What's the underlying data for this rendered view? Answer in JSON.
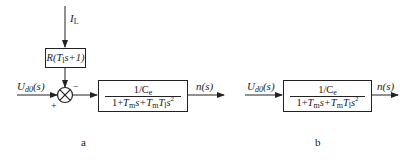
{
  "diagram_a": {
    "disturbance_label_main": "I",
    "disturbance_label_sub": "L",
    "feedback_block": {
      "prefix": "R(",
      "T": "T",
      "T_sub": "l",
      "suffix": "s+1)"
    },
    "input_label_main": "U",
    "input_label_sub": "d0",
    "input_label_arg": "(s)",
    "summing_junction": {
      "plus_sign": "+",
      "minus_sign": "−"
    },
    "transfer_block": {
      "numerator_main": "1/C",
      "numerator_sub": "e",
      "denominator_parts": [
        "1+",
        "T",
        "m",
        "s+",
        "T",
        "m",
        "T",
        "l",
        "s",
        "2"
      ]
    },
    "output_label": "n(s)",
    "caption": "a"
  },
  "diagram_b": {
    "input_label_main": "U",
    "input_label_sub": "d0",
    "input_label_arg": "(s)",
    "transfer_block": {
      "numerator_main": "1/C",
      "numerator_sub": "e",
      "denominator_parts": [
        "1+",
        "T",
        "m",
        "s+",
        "T",
        "m",
        "T",
        "l",
        "s",
        "2"
      ]
    },
    "output_label": "n(s)",
    "caption": "b"
  },
  "colors": {
    "line": "#222222",
    "background": "#ffffff"
  }
}
